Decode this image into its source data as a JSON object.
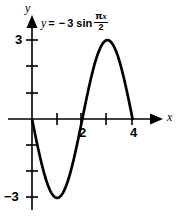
{
  "figure": {
    "background_color": "#ffffff",
    "stroke_color": "#000000"
  },
  "equation": {
    "lhs": "y",
    "equals": "=",
    "minus": "−",
    "amplitude": "3",
    "function": "sin",
    "numerator_pi": "π",
    "numerator_x": "x",
    "denominator": "2",
    "full_text": "y = −3 sin πx/2"
  },
  "axes": {
    "x_label": "x",
    "y_label": "y",
    "x_tick_labels": [
      "2",
      "4"
    ],
    "y_tick_labels": [
      "3",
      "−3"
    ],
    "x_label_2": "2",
    "x_label_4": "4",
    "y_label_pos3": "3",
    "y_label_neg3": "−3"
  },
  "chart_data": {
    "type": "line",
    "title": "",
    "subtitle": "",
    "xlabel": "x",
    "ylabel": "y",
    "equation": "y = -3 sin(pi*x/2)",
    "amplitude": -3,
    "period": 4,
    "xlim": [
      -0.3,
      4.8
    ],
    "ylim": [
      -3.6,
      3.6
    ],
    "grid": false,
    "legend": null,
    "x_ticks": [
      1,
      2,
      3,
      4
    ],
    "x_tick_labels_shown": {
      "2": "2",
      "4": "4"
    },
    "y_ticks": [
      -3,
      -2,
      -1,
      1,
      2,
      3
    ],
    "y_tick_labels_shown": {
      "3": "3",
      "-3": "-3"
    },
    "x_axis_arrow": true,
    "y_axis_arrow": true,
    "x": [
      0,
      0.25,
      0.5,
      0.75,
      1,
      1.25,
      1.5,
      1.75,
      2,
      2.25,
      2.5,
      2.75,
      3,
      3.25,
      3.5,
      3.75,
      4
    ],
    "y": [
      0,
      -1.148,
      -2.121,
      -2.772,
      -3,
      -2.772,
      -2.121,
      -1.148,
      0,
      1.148,
      2.121,
      2.772,
      3,
      2.772,
      2.121,
      1.148,
      0
    ],
    "key_points": [
      {
        "x": 0,
        "y": 0,
        "type": "zero"
      },
      {
        "x": 1,
        "y": -3,
        "type": "minimum"
      },
      {
        "x": 2,
        "y": 0,
        "type": "zero"
      },
      {
        "x": 3,
        "y": 3,
        "type": "maximum"
      },
      {
        "x": 4,
        "y": 0,
        "type": "zero"
      }
    ]
  }
}
